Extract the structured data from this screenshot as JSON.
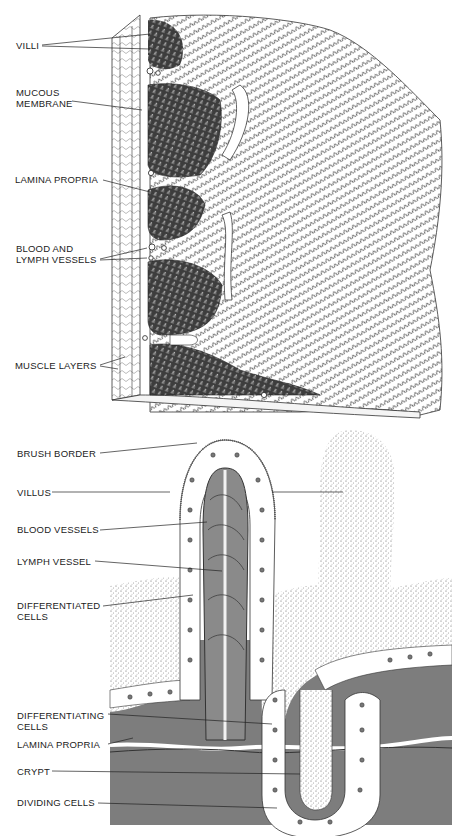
{
  "top_figure": {
    "labels": [
      {
        "id": "villi",
        "lines": [
          "VILLI"
        ]
      },
      {
        "id": "mucous-membrane",
        "lines": [
          "MUCOUS",
          "MEMBRANE"
        ]
      },
      {
        "id": "lamina-propria",
        "lines": [
          "LAMINA PROPRIA"
        ]
      },
      {
        "id": "blood-lymph-vessels",
        "lines": [
          "BLOOD AND",
          "LYMPH VESSELS"
        ]
      },
      {
        "id": "muscle-layers",
        "lines": [
          "MUSCLE LAYERS"
        ]
      }
    ]
  },
  "bottom_figure": {
    "labels": [
      {
        "id": "brush-border",
        "lines": [
          "BRUSH BORDER"
        ]
      },
      {
        "id": "villus",
        "lines": [
          "VILLUS"
        ]
      },
      {
        "id": "blood-vessels",
        "lines": [
          "BLOOD VESSELS"
        ]
      },
      {
        "id": "lymph-vessel",
        "lines": [
          "LYMPH VESSEL"
        ]
      },
      {
        "id": "differentiated-cells",
        "lines": [
          "DIFFERENTIATED",
          "CELLS"
        ]
      },
      {
        "id": "differentiating-cells",
        "lines": [
          "DIFFERENTIATING",
          "CELLS"
        ]
      },
      {
        "id": "lamina-propria-2",
        "lines": [
          "LAMINA PROPRIA"
        ]
      },
      {
        "id": "crypt",
        "lines": [
          "CRYPT"
        ]
      },
      {
        "id": "dividing-cells",
        "lines": [
          "DIVIDING CELLS"
        ]
      }
    ]
  },
  "colors": {
    "tissue_dark": "#4a4a4a",
    "lamina_gray": "#7a7a7a",
    "vessel_gray": "#8c8c8c",
    "line": "#222222",
    "background": "#ffffff"
  }
}
